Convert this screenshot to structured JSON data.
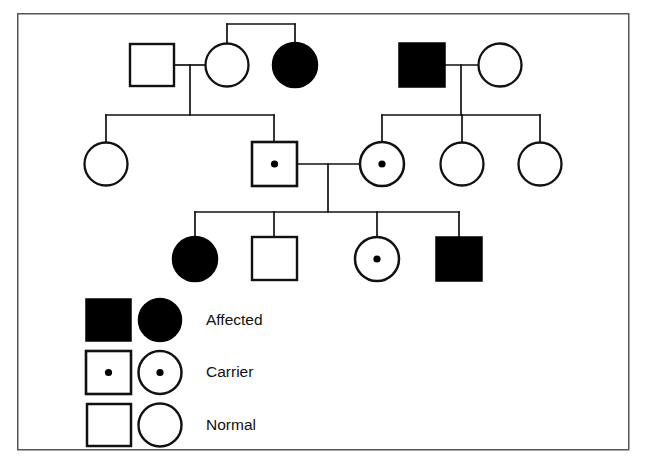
{
  "figure": {
    "type": "pedigree-chart",
    "title_visible": false,
    "border": {
      "x": 17,
      "y": 13,
      "width": 612,
      "height": 437,
      "color": "#555555",
      "stroke": 1.5
    },
    "line_color": "#111111",
    "fill_affected": "#000000",
    "fill_normal": "#ffffff",
    "stroke_color": "#111111"
  },
  "legend": {
    "rows": [
      {
        "key": "affected",
        "label": "Affected",
        "square_status": "affected",
        "circle_status": "affected"
      },
      {
        "key": "carrier",
        "label": "Carrier",
        "square_status": "carrier",
        "circle_status": "carrier"
      },
      {
        "key": "normal",
        "label": "Normal",
        "square_status": "normal",
        "circle_status": "normal"
      }
    ]
  },
  "generations": [
    {
      "id": "generation-1",
      "individuals": [
        {
          "id": "i1-1",
          "shape": "square",
          "status": "normal",
          "cx": 152,
          "cy": 65
        },
        {
          "id": "i1-2",
          "shape": "circle",
          "status": "normal",
          "cx": 227,
          "cy": 65
        },
        {
          "id": "i1-3",
          "shape": "circle",
          "status": "affected",
          "cx": 295,
          "cy": 65
        },
        {
          "id": "i1-4",
          "shape": "square",
          "status": "affected",
          "cx": 422,
          "cy": 65
        },
        {
          "id": "i1-5",
          "shape": "circle",
          "status": "normal",
          "cx": 500,
          "cy": 65
        }
      ]
    },
    {
      "id": "generation-2",
      "individuals": [
        {
          "id": "i2-1",
          "shape": "circle",
          "status": "normal",
          "cx": 106,
          "cy": 164
        },
        {
          "id": "i2-2",
          "shape": "square",
          "status": "carrier",
          "cx": 274,
          "cy": 164
        },
        {
          "id": "i2-3",
          "shape": "circle",
          "status": "carrier",
          "cx": 382,
          "cy": 164
        },
        {
          "id": "i2-4",
          "shape": "circle",
          "status": "normal",
          "cx": 462,
          "cy": 164
        },
        {
          "id": "i2-5",
          "shape": "circle",
          "status": "normal",
          "cx": 540,
          "cy": 164
        }
      ]
    },
    {
      "id": "generation-3",
      "individuals": [
        {
          "id": "i3-1",
          "shape": "circle",
          "status": "affected",
          "cx": 195,
          "cy": 259
        },
        {
          "id": "i3-2",
          "shape": "square",
          "status": "normal",
          "cx": 274,
          "cy": 259
        },
        {
          "id": "i3-3",
          "shape": "circle",
          "status": "carrier",
          "cx": 377,
          "cy": 259
        },
        {
          "id": "i3-4",
          "shape": "square",
          "status": "affected",
          "cx": 459,
          "cy": 259
        }
      ]
    }
  ],
  "relationships": {
    "matings": [
      {
        "id": "mating-1",
        "partners": [
          "i1-1",
          "i1-2"
        ],
        "children": [
          "i2-1",
          "i2-2"
        ]
      },
      {
        "id": "mating-2",
        "partners": [
          "i1-4",
          "i1-5"
        ],
        "children": [
          "i2-3",
          "i2-4",
          "i2-5"
        ]
      },
      {
        "id": "mating-3",
        "partners": [
          "i2-2",
          "i2-3"
        ],
        "children": [
          "i3-1",
          "i3-2",
          "i3-3",
          "i3-4"
        ]
      }
    ],
    "sibships": [
      {
        "id": "sibship-1",
        "members": [
          "i1-2",
          "i1-3"
        ]
      }
    ]
  }
}
